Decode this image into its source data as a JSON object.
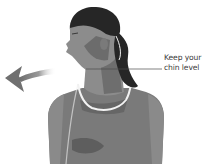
{
  "illustration": {
    "subject": "woman turning head to the side, neck rotation stretch",
    "annotation": {
      "line1": "Keep your",
      "line2": "chin level"
    },
    "arrow": {
      "direction": "left",
      "icon": "curved-arrow-left-icon"
    },
    "colors": {
      "background": "#ffffff",
      "skin_light": "#8c8c8c",
      "skin_mid": "#727272",
      "skin_dark": "#555555",
      "hair": "#262626",
      "top": "#7a7a7a",
      "top_trim": "#f2f2f2",
      "arrow": "#6e6e6e",
      "leader_line": "#4a4a4a",
      "text": "#3a3a3a"
    }
  }
}
